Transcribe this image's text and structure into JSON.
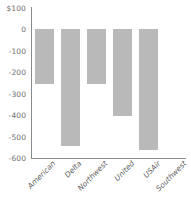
{
  "chart_data": {
    "type": "bar",
    "title": "",
    "xlabel": "",
    "ylabel": "",
    "categories": [
      "American",
      "Delta",
      "Northwest",
      "United",
      "USAir",
      "Southwest"
    ],
    "values": [
      -255,
      -545,
      -255,
      -405,
      -565,
      0
    ],
    "ylim": [
      -600,
      100
    ],
    "yticks": [
      100,
      0,
      -100,
      -200,
      -300,
      -400,
      -500,
      -600
    ],
    "ytick_labels": [
      "$100",
      "0",
      "-100",
      "-200",
      "-300",
      "-400",
      "-500",
      "-600"
    ],
    "grid": false,
    "legend": false,
    "bar_color": "#b9b9b9",
    "axis_color": "#8a8a8a",
    "tick_label_color": "#6d6d6d",
    "category_label_color": "#5e5e5e"
  }
}
